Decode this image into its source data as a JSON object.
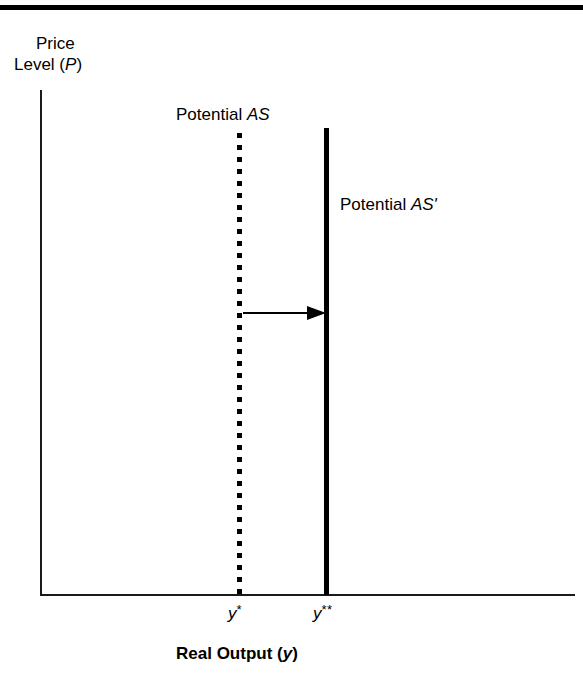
{
  "figure": {
    "type": "economics-diagram",
    "title_rule_color": "#000000",
    "background": "#ffffff",
    "line_color": "#000000"
  },
  "axes": {
    "y_axis": {
      "title_line_one": "Price",
      "title_line_two_prefix": "Level (",
      "title_line_two_variable": "P",
      "title_line_two_suffix": ")"
    },
    "x_axis": {
      "title_prefix": "Real Output (",
      "title_variable": "y",
      "title_suffix": ")"
    }
  },
  "curves": [
    {
      "id": "potential-as",
      "label_prefix": "Potential ",
      "label_variable": "AS",
      "style": "dotted",
      "color": "#000000"
    },
    {
      "id": "potential-as-prime",
      "label_prefix": "Potential ",
      "label_variable": "AS'",
      "style": "solid",
      "color": "#000000"
    }
  ],
  "tick_labels": {
    "y_star": {
      "variable": "y",
      "superscript": "*"
    },
    "y_double_star": {
      "variable": "y",
      "superscript": "**"
    }
  },
  "annotations": {
    "shift_arrow": {
      "direction": "right",
      "from": "potential-as",
      "to": "potential-as-prime"
    }
  },
  "chart_data": {
    "type": "line",
    "title": "",
    "xlabel": "Real Output (y)",
    "ylabel": "Price Level (P)",
    "grid": false,
    "legend": "none",
    "series": [
      {
        "name": "Potential AS",
        "style": "dotted",
        "orientation": "vertical",
        "x": 240,
        "x_tick_label": "y*"
      },
      {
        "name": "Potential AS'",
        "style": "solid",
        "orientation": "vertical",
        "x": 327,
        "x_tick_label": "y**"
      }
    ],
    "annotations": [
      {
        "type": "arrow",
        "label": "rightward shift of potential output",
        "x_start": 243,
        "x_end": 325,
        "y": 313
      }
    ]
  }
}
